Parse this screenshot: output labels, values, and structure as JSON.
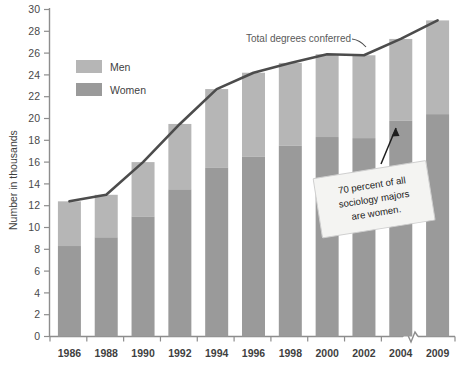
{
  "chart_data": {
    "type": "bar",
    "subtype": "stacked-bar-with-line-overlay",
    "title": "",
    "xlabel": "",
    "ylabel": "Number in thousands",
    "ylim": [
      0,
      30
    ],
    "ytick_step": 2,
    "yticks": [
      "0",
      "2",
      "4",
      "6",
      "8",
      "10",
      "12",
      "14",
      "16",
      "18",
      "20",
      "22",
      "24",
      "26",
      "28",
      "30"
    ],
    "grid": false,
    "legend_position": "top-left",
    "axis_break_between": [
      "2004",
      "2009"
    ],
    "categories": [
      "1986",
      "1988",
      "1990",
      "1992",
      "1994",
      "1996",
      "1998",
      "2000",
      "2002",
      "2004",
      "2009"
    ],
    "series": [
      {
        "name": "Women",
        "color": "#9a9a9a",
        "values": [
          8.3,
          9.1,
          11.0,
          13.5,
          15.5,
          16.5,
          17.5,
          18.3,
          18.2,
          19.8,
          20.4
        ]
      },
      {
        "name": "Men",
        "color": "#b6b6b6",
        "values": [
          4.1,
          3.9,
          5.0,
          6.0,
          7.2,
          7.7,
          7.6,
          7.6,
          7.6,
          7.5,
          8.6
        ]
      }
    ],
    "line_series": {
      "name": "Total degrees conferred",
      "color": "#4c4c4c",
      "values": [
        12.4,
        13.0,
        16.0,
        19.5,
        22.7,
        24.2,
        25.1,
        25.9,
        25.8,
        27.3,
        29.0
      ]
    },
    "annotations": [
      {
        "name": "total-line-label",
        "text": "Total degrees conferred"
      },
      {
        "name": "women-callout",
        "text_lines": [
          "70 percent of all",
          "sociology majors",
          "are women."
        ],
        "text": "70 percent of all sociology majors are women.",
        "points_to": "2004"
      }
    ],
    "legend": [
      {
        "label": "Men",
        "color": "#b6b6b6"
      },
      {
        "label": "Women",
        "color": "#9a9a9a"
      }
    ]
  },
  "colors": {
    "men": "#b6b6b6",
    "women": "#9a9a9a",
    "line": "#4c4c4c",
    "axis": "#8d8d8d",
    "text": "#3f3f3f",
    "callout_bg": "#f4f4f2",
    "callout_border": "#cfcfcf"
  }
}
